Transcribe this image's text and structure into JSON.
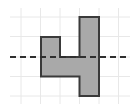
{
  "figure": {
    "canvas": {
      "width": 140,
      "height": 112,
      "background": "#ffffff"
    },
    "grid": {
      "visible": true,
      "color": "#e8e8e8",
      "line_width": 1,
      "spacing": 19.5,
      "vertical_lines_x": [
        21,
        40.5,
        60,
        79.5,
        99,
        118.5
      ],
      "horizontal_lines_y": [
        17,
        36.5,
        57,
        76.5,
        96
      ]
    },
    "axis": {
      "name": "axis-of-symmetry",
      "orientation": "horizontal",
      "style": "dashed",
      "color": "#2f2f2f",
      "line_width": 2,
      "dash_pattern": "6,4",
      "y": 57,
      "x_start": 10,
      "x_end": 130
    },
    "shape": {
      "name": "step-polygon",
      "fill": "#a9a9a9",
      "stroke": "#3a3a3a",
      "stroke_width": 2,
      "points": [
        [
          41,
          37
        ],
        [
          60,
          37
        ],
        [
          60,
          57
        ],
        [
          79.5,
          57
        ],
        [
          79.5,
          17
        ],
        [
          99,
          17
        ],
        [
          99,
          96
        ],
        [
          79.5,
          96
        ],
        [
          79.5,
          76.5
        ],
        [
          41,
          76.5
        ]
      ],
      "points_string": "41,37 60,37 60,57 79.5,57 79.5,17 99,17 99,96 79.5,96 79.5,76.5 41,76.5",
      "parts": [
        {
          "label": "left-block",
          "x": 41,
          "y": 37,
          "width": 19,
          "height": 39.5
        },
        {
          "label": "horizontal-bar",
          "x": 41,
          "y": 57,
          "width": 38.5,
          "height": 19.5
        },
        {
          "label": "tall-right-block",
          "x": 79.5,
          "y": 17,
          "width": 19.5,
          "height": 79
        },
        {
          "label": "notch-cutout",
          "x": 60,
          "y": 37,
          "width": 19.5,
          "height": 20
        }
      ]
    }
  }
}
